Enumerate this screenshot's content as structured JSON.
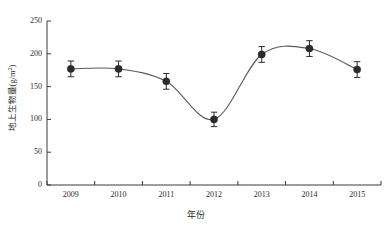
{
  "chart_data": {
    "type": "line",
    "title": "",
    "subtitle": "",
    "xlabel": "年份",
    "ylabel": "地上生物量(g/m²)",
    "ylabel_main": "地上生物量(g/m",
    "ylabel_sup": "2",
    "ylabel_tail": ")",
    "categories": [
      "2009",
      "2010",
      "2011",
      "2012",
      "2013",
      "2014",
      "2015"
    ],
    "x": [
      2009,
      2010,
      2011,
      2012,
      2013,
      2014,
      2015
    ],
    "values": [
      177,
      177,
      158,
      100,
      199,
      208,
      176
    ],
    "errors": [
      12,
      12,
      12,
      11,
      12,
      12,
      12
    ],
    "series": [
      {
        "name": "地上生物量",
        "values": [
          177,
          177,
          158,
          100,
          199,
          208,
          176
        ],
        "errors": [
          12,
          12,
          12,
          11,
          12,
          12,
          12
        ]
      }
    ],
    "ylim": [
      0,
      250
    ],
    "yticks": [
      0,
      50,
      100,
      150,
      200,
      250
    ],
    "ytick_labels": [
      "0",
      "50",
      "100",
      "150",
      "200",
      "250"
    ],
    "xtick_labels": [
      "2009",
      "2010",
      "2011",
      "2012",
      "2013",
      "2014",
      "2015"
    ],
    "grid": false,
    "legend": false,
    "legend_position": "none",
    "marker": "filled-circle",
    "line_style": "smooth-spline",
    "colors": {
      "line": "#5a5a5a",
      "marker": "#2b2b2b",
      "error_bar": "#2b2b2b",
      "axis": "#3a3a3a",
      "text": "#2b2b2b",
      "background": "#ffffff"
    },
    "annotations": []
  }
}
